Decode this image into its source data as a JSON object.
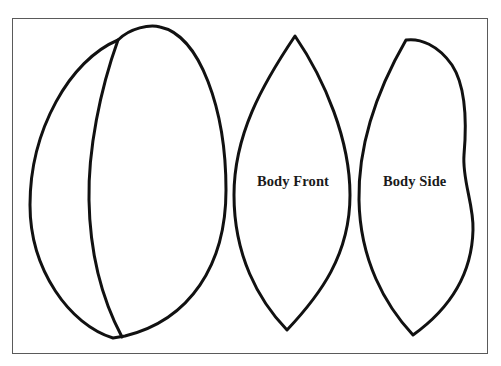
{
  "pattern": {
    "pieces": [
      {
        "id": "head-gusset",
        "label": ""
      },
      {
        "id": "body-front",
        "label": "Body Front"
      },
      {
        "id": "body-side",
        "label": "Body Side"
      }
    ]
  },
  "colors": {
    "outline": "#111111",
    "frame": "#5a5a5a",
    "background": "#ffffff",
    "text": "#1a1a1a"
  }
}
